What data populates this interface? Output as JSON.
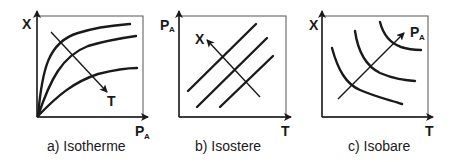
{
  "figure": {
    "panels": [
      {
        "id": "isotherme",
        "caption": "a) Isotherme",
        "y_axis": {
          "label": "X",
          "subscript": ""
        },
        "x_axis": {
          "label": "P",
          "subscript": "A"
        },
        "parameter_arrow": {
          "label": "T",
          "subscript": "",
          "direction": "down-right"
        },
        "curve_count": 3,
        "curve_shape": "concave-saturating"
      },
      {
        "id": "isostere",
        "caption": "b) Isostere",
        "y_axis": {
          "label": "P",
          "subscript": "A"
        },
        "x_axis": {
          "label": "T",
          "subscript": ""
        },
        "parameter_arrow": {
          "label": "X",
          "subscript": "",
          "direction": "up-left"
        },
        "curve_count": 3,
        "curve_shape": "straight-increasing"
      },
      {
        "id": "isobare",
        "caption": "c) Isobare",
        "y_axis": {
          "label": "X",
          "subscript": ""
        },
        "x_axis": {
          "label": "T",
          "subscript": ""
        },
        "parameter_arrow": {
          "label": "P",
          "subscript": "A",
          "direction": "up-right"
        },
        "curve_count": 3,
        "curve_shape": "convex-decreasing"
      }
    ]
  },
  "colors": {
    "ink": "#1a1a1a",
    "frame": "#555555",
    "background": "#ffffff"
  }
}
